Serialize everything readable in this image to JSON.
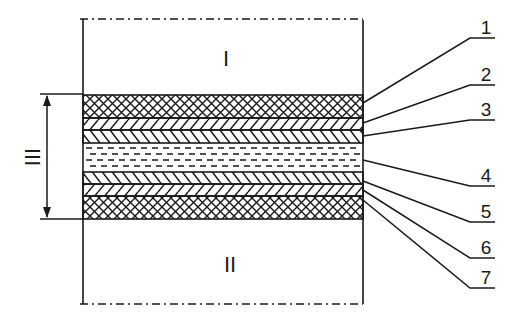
{
  "diagram": {
    "type": "layered-cross-section",
    "regions": {
      "top": {
        "label": "I"
      },
      "bottom": {
        "label": "II"
      },
      "layer_stack": {
        "label": "III"
      }
    },
    "layers": [
      {
        "number": "1",
        "pattern": "cross-hatch"
      },
      {
        "number": "2",
        "pattern": "hatch-forward"
      },
      {
        "number": "3",
        "pattern": "hatch-backward"
      },
      {
        "number": "4",
        "pattern": "dashed"
      },
      {
        "number": "5",
        "pattern": "hatch-backward"
      },
      {
        "number": "6",
        "pattern": "hatch-forward"
      },
      {
        "number": "7",
        "pattern": "cross-hatch"
      }
    ],
    "colors": {
      "ink": "#1a1a1a",
      "background": "#ffffff"
    }
  }
}
